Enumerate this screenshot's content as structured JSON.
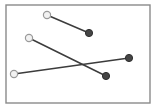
{
  "figure": {
    "title": "",
    "background_color": "#ffffff"
  },
  "frame": {
    "label": "plot-border",
    "x": 6,
    "y": 5,
    "width": 144,
    "height": 98,
    "stroke_color": "#8a8a8a",
    "fill_color": "#ffffff"
  },
  "style": {
    "line_color": "#3c3c3c",
    "line_width": 1.5,
    "open_marker_fill": "#f2f2f2",
    "open_marker_stroke": "#9a9a9a",
    "filled_marker_fill": "#454545",
    "filled_marker_stroke": "#2e2e2e",
    "marker_radius": 3.6
  },
  "chart_data": {
    "type": "scatter",
    "title": "",
    "xlabel": "",
    "ylabel": "",
    "xlim": [
      6,
      150
    ],
    "ylim": [
      5,
      103
    ],
    "grid": false,
    "legend": "none",
    "annotations": [
      {
        "name": "crossing-point",
        "x": 78,
        "y": 64,
        "note": "segment-2 and segment-3 intersect"
      }
    ],
    "series": [
      {
        "name": "segment-1",
        "start": {
          "x": 47,
          "y": 15,
          "marker": "open"
        },
        "end": {
          "x": 89,
          "y": 33,
          "marker": "filled"
        }
      },
      {
        "name": "segment-2",
        "start": {
          "x": 29,
          "y": 38,
          "marker": "open"
        },
        "end": {
          "x": 106,
          "y": 76,
          "marker": "filled"
        }
      },
      {
        "name": "segment-3",
        "start": {
          "x": 14,
          "y": 74,
          "marker": "open"
        },
        "end": {
          "x": 129,
          "y": 58,
          "marker": "filled"
        }
      }
    ]
  }
}
